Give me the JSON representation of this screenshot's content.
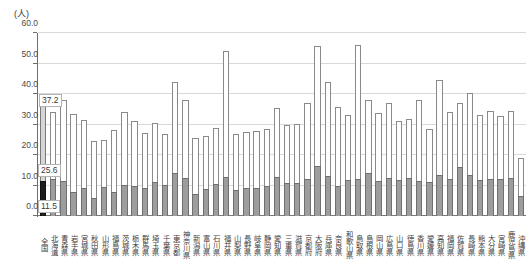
{
  "chart_data": {
    "type": "bar",
    "subtype": "stacked-bar",
    "title": "",
    "ylabel": "(人)",
    "xlabel": "",
    "ylim": [
      0,
      60
    ],
    "yticks": [
      "0.0",
      "10.0",
      "20.0",
      "30.0",
      "40.0",
      "50.0",
      "60.0"
    ],
    "ytick_values": [
      0,
      10,
      20,
      30,
      40,
      50,
      60
    ],
    "grid": true,
    "legend": "none",
    "annotations": [
      {
        "text": "37.2",
        "meaning": "national-total",
        "category": "全国"
      },
      {
        "text": "25.6",
        "meaning": "national-upper-segment",
        "category": "全国"
      },
      {
        "text": "11.5",
        "meaning": "national-lower-segment",
        "category": "全国"
      }
    ],
    "categories": [
      "全国",
      "北海道",
      "青森県",
      "岩手県",
      "宮城県",
      "秋田県",
      "山形県",
      "福島県",
      "茨城県",
      "栃木県",
      "群馬県",
      "埼玉県",
      "千葉県",
      "東京都",
      "神奈川県",
      "新潟県",
      "富山県",
      "石川県",
      "福井県",
      "山梨県",
      "長野県",
      "岐阜県",
      "静岡県",
      "愛知県",
      "三重県",
      "滋賀県",
      "京都府",
      "大阪府",
      "兵庫県",
      "奈良県",
      "和歌山県",
      "鳥取県",
      "島根県",
      "岡山県",
      "広島県",
      "山口県",
      "徳島県",
      "香川県",
      "愛媛県",
      "高知県",
      "福岡県",
      "佐賀県",
      "長崎県",
      "熊本県",
      "大分県",
      "宮崎県",
      "鹿児島県",
      "沖縄県"
    ],
    "series": [
      {
        "name": "lower",
        "values": [
          11.5,
          12.0,
          11.6,
          8.0,
          9.1,
          5.9,
          9.4,
          8.0,
          10.1,
          10.0,
          9.3,
          11.2,
          10.3,
          14.2,
          12.4,
          7.1,
          9.0,
          10.4,
          12.9,
          8.4,
          9.3,
          9.3,
          10.0,
          12.8,
          10.8,
          10.8,
          12.2,
          16.4,
          13.2,
          10.0,
          11.9,
          12.1,
          14.0,
          11.4,
          12.6,
          11.8,
          12.4,
          11.5,
          11.3,
          13.5,
          12.0,
          16.0,
          13.3,
          11.8,
          12.1,
          12.0,
          12.4,
          6.5
        ]
      },
      {
        "name": "upper",
        "values": [
          25.6,
          22.2,
          26.4,
          25.4,
          22.5,
          18.7,
          15.6,
          20.2,
          24.1,
          21.0,
          18.0,
          19.4,
          16.5,
          29.9,
          25.6,
          18.6,
          17.1,
          18.6,
          41.2,
          18.4,
          18.2,
          18.6,
          18.4,
          22.5,
          19.1,
          19.3,
          24.8,
          39.2,
          30.6,
          25.6,
          21.2,
          43.9,
          24.2,
          22.5,
          24.6,
          19.4,
          19.3,
          26.4,
          17.1,
          31.2,
          22.0,
          21.0,
          26.9,
          21.4,
          22.4,
          20.7,
          22.0,
          12.6
        ]
      }
    ],
    "totals": [
      37.2,
      34.2,
      38.0,
      33.4,
      31.6,
      24.6,
      25.0,
      28.2,
      34.2,
      31.0,
      27.3,
      30.6,
      26.8,
      44.1,
      38.0,
      25.7,
      26.1,
      29.0,
      54.1,
      26.8,
      27.5,
      27.9,
      28.4,
      35.3,
      29.9,
      30.1,
      37.0,
      55.6,
      43.8,
      35.6,
      33.1,
      56.0,
      38.2,
      33.9,
      37.2,
      31.2,
      31.7,
      37.9,
      28.4,
      44.7,
      34.0,
      37.0,
      40.2,
      33.2,
      34.5,
      32.7,
      34.4,
      19.1
    ],
    "colors": {
      "lower": "#9d9d9d",
      "upper": "#ffffff",
      "national_lower": "#1d1d1d",
      "national_upper": "#d6d6d6",
      "grid": "#d9d9d9",
      "axis": "#6e6e6e"
    }
  }
}
